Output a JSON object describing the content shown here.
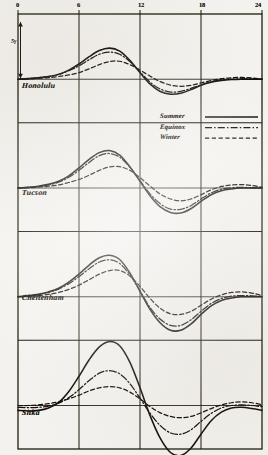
{
  "figure": {
    "kind": "scanned-scientific-figure",
    "ink_color": "#141109",
    "paper_color": "#f4f2ee",
    "width": 268,
    "height": 455
  },
  "axis": {
    "x_ticks": [
      "0",
      "6",
      "12",
      "18",
      "24"
    ],
    "x_tick_hours": [
      0,
      6,
      12,
      18,
      24
    ],
    "gridline_hours": [
      6,
      12,
      18
    ],
    "x_min": 0,
    "x_max": 24
  },
  "scale_bar": {
    "label": "5γ",
    "description": "vertical double-headed arrow amplitude scale"
  },
  "legend": {
    "items": [
      {
        "label": "Summer",
        "style": "solid"
      },
      {
        "label": "Equinox",
        "style": "dash-dot"
      },
      {
        "label": "Winter",
        "style": "dashed"
      }
    ]
  },
  "panels": [
    {
      "name": "Honolulu"
    },
    {
      "name": "Tucson"
    },
    {
      "name": "Cheltenham"
    },
    {
      "name": "Sitka"
    }
  ],
  "chart_data": {
    "type": "line",
    "title": "",
    "xlabel": "",
    "ylabel": "",
    "xlim": [
      0,
      24
    ],
    "grid": true,
    "legend_position": "upper-right-of-second-panel",
    "x": [
      0,
      1,
      2,
      3,
      4,
      5,
      6,
      7,
      8,
      9,
      10,
      11,
      12,
      13,
      14,
      15,
      16,
      17,
      18,
      19,
      20,
      21,
      22,
      23,
      24
    ],
    "panels": [
      {
        "name": "Honolulu",
        "baseline_label": "0",
        "series": [
          {
            "name": "Summer",
            "style": "solid",
            "values": [
              0.0,
              0.2,
              0.5,
              0.9,
              1.6,
              3.0,
              5.0,
              7.4,
              9.4,
              10.2,
              9.2,
              6.2,
              2.2,
              -1.6,
              -4.0,
              -4.9,
              -4.6,
              -3.4,
              -2.0,
              -1.0,
              -0.4,
              -0.1,
              0.0,
              0.0,
              0.0
            ]
          },
          {
            "name": "Equinox",
            "style": "dash-dot",
            "values": [
              0.0,
              0.2,
              0.5,
              0.9,
              1.6,
              2.8,
              4.4,
              6.4,
              8.2,
              8.9,
              8.2,
              5.8,
              2.4,
              -1.0,
              -3.2,
              -4.2,
              -4.0,
              -3.0,
              -1.8,
              -0.8,
              -0.2,
              0.0,
              0.1,
              0.1,
              0.0
            ]
          },
          {
            "name": "Winter",
            "style": "dashed",
            "values": [
              0.0,
              0.1,
              0.3,
              0.5,
              0.9,
              1.4,
              2.2,
              3.4,
              4.8,
              5.8,
              5.9,
              4.8,
              3.0,
              1.0,
              -0.8,
              -1.9,
              -2.3,
              -2.0,
              -1.2,
              -0.4,
              0.2,
              0.5,
              0.6,
              0.4,
              0.1
            ]
          }
        ]
      },
      {
        "name": "Tucson",
        "baseline_label": "0",
        "series": [
          {
            "name": "Summer",
            "style": "solid",
            "values": [
              0.0,
              0.2,
              0.6,
              1.2,
              2.2,
              4.0,
              6.6,
              9.4,
              11.6,
              12.3,
              10.8,
              7.0,
              2.2,
              -2.6,
              -6.2,
              -8.0,
              -8.2,
              -6.8,
              -4.4,
              -2.2,
              -0.9,
              -0.3,
              0.0,
              0.0,
              0.0
            ]
          },
          {
            "name": "Equinox",
            "style": "dash-dot",
            "values": [
              0.0,
              0.2,
              0.5,
              1.0,
              1.9,
              3.5,
              5.8,
              8.4,
              10.6,
              11.3,
              10.1,
              6.8,
              2.4,
              -2.0,
              -5.2,
              -6.9,
              -7.0,
              -5.8,
              -3.6,
              -1.6,
              -0.4,
              0.1,
              0.2,
              0.1,
              0.0
            ]
          },
          {
            "name": "Winter",
            "style": "dashed",
            "values": [
              0.0,
              0.1,
              0.3,
              0.6,
              1.0,
              1.8,
              2.8,
              4.2,
              5.8,
              6.9,
              7.0,
              5.8,
              3.4,
              0.6,
              -2.0,
              -3.6,
              -4.2,
              -3.6,
              -2.2,
              -0.6,
              0.5,
              1.0,
              1.1,
              0.8,
              0.2
            ]
          }
        ]
      },
      {
        "name": "Cheltenham",
        "baseline_label": "0",
        "series": [
          {
            "name": "Summer",
            "style": "solid",
            "values": [
              0.0,
              0.3,
              0.8,
              1.6,
              2.8,
              4.8,
              7.4,
              10.4,
              12.8,
              13.6,
              12.2,
              7.8,
              1.8,
              -4.2,
              -8.6,
              -11.0,
              -11.0,
              -9.0,
              -5.8,
              -3.0,
              -1.2,
              -0.4,
              0.0,
              0.0,
              0.0
            ]
          },
          {
            "name": "Equinox",
            "style": "dash-dot",
            "values": [
              0.0,
              0.2,
              0.7,
              1.4,
              2.5,
              4.3,
              6.6,
              9.2,
              11.4,
              12.1,
              10.9,
              7.2,
              1.9,
              -3.6,
              -7.4,
              -9.4,
              -9.4,
              -7.6,
              -4.8,
              -2.2,
              -0.6,
              0.2,
              0.4,
              0.3,
              0.1
            ]
          },
          {
            "name": "Winter",
            "style": "dashed",
            "values": [
              0.0,
              0.2,
              0.4,
              0.8,
              1.4,
              2.4,
              3.8,
              5.6,
              7.4,
              8.6,
              8.6,
              6.8,
              3.4,
              -0.6,
              -3.8,
              -5.6,
              -5.8,
              -4.8,
              -2.8,
              -0.8,
              0.6,
              1.4,
              1.6,
              1.2,
              0.4
            ]
          }
        ]
      },
      {
        "name": "Sitka",
        "baseline_label": "0",
        "series": [
          {
            "name": "Summer",
            "style": "solid",
            "values": [
              -1.6,
              -1.8,
              -1.6,
              -0.8,
              1.0,
              4.6,
              9.6,
              15.0,
              19.2,
              21.0,
              19.6,
              14.2,
              5.8,
              -3.4,
              -10.8,
              -15.4,
              -16.4,
              -14.0,
              -9.4,
              -5.0,
              -2.2,
              -0.8,
              -0.6,
              -1.0,
              -1.6
            ]
          },
          {
            "name": "Equinox",
            "style": "dash-dot",
            "values": [
              -0.6,
              -0.7,
              -0.6,
              -0.2,
              0.8,
              2.6,
              5.2,
              8.2,
              10.6,
              11.4,
              10.4,
              7.2,
              2.4,
              -2.6,
              -6.6,
              -9.0,
              -9.4,
              -8.0,
              -5.2,
              -2.6,
              -0.8,
              0.0,
              0.2,
              0.0,
              -0.4
            ]
          },
          {
            "name": "Winter",
            "style": "dashed",
            "values": [
              0.0,
              0.0,
              0.2,
              0.6,
              1.2,
              2.2,
              3.4,
              4.8,
              5.8,
              6.2,
              5.8,
              4.4,
              2.2,
              -0.4,
              -2.4,
              -3.6,
              -4.0,
              -3.6,
              -2.4,
              -1.0,
              0.2,
              0.9,
              1.2,
              0.9,
              0.3
            ]
          }
        ]
      }
    ]
  }
}
